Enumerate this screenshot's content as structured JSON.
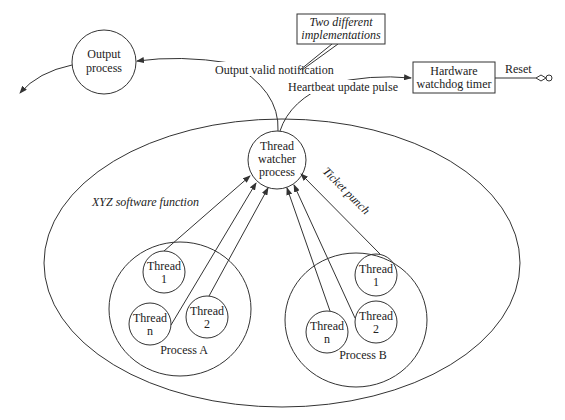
{
  "diagram": {
    "nodes": {
      "output_process": {
        "line1": "Output",
        "line2": "process"
      },
      "thread_watcher": {
        "line1": "Thread",
        "line2": "watcher",
        "line3": "process"
      },
      "hardware_watchdog": {
        "line1": "Hardware",
        "line2": "watchdog timer"
      },
      "callout": {
        "line1": "Two different",
        "line2": "implementations"
      },
      "software_function": {
        "label": "XYZ software function"
      },
      "process_a": {
        "label": "Process A",
        "threads": [
          {
            "line1": "Thread",
            "line2": "1"
          },
          {
            "line1": "Thread",
            "line2": "2"
          },
          {
            "line1": "Thread",
            "line2": "n"
          }
        ]
      },
      "process_b": {
        "label": "Process B",
        "threads": [
          {
            "line1": "Thread",
            "line2": "1"
          },
          {
            "line1": "Thread",
            "line2": "2"
          },
          {
            "line1": "Thread",
            "line2": "n"
          }
        ]
      }
    },
    "edges": {
      "output_valid": "Output valid notification",
      "heartbeat": "Heartbeat update pulse",
      "reset": "Reset",
      "ticket_punch": "Ticket punch"
    },
    "colors": {
      "stroke": "#333333",
      "text": "#222222",
      "background": "#ffffff"
    }
  }
}
